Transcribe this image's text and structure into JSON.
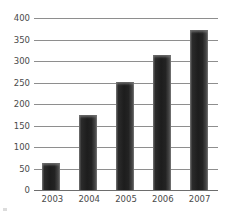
{
  "chart_data": {
    "type": "bar",
    "title": "",
    "subtitle": "",
    "xlabel": "",
    "ylabel": "",
    "categories": [
      "2003",
      "2004",
      "2005",
      "2006",
      "2007"
    ],
    "values": [
      62,
      175,
      252,
      313,
      372
    ],
    "series": [
      {
        "name": "Value",
        "values": [
          62,
          175,
          252,
          313,
          372
        ]
      }
    ],
    "ylim": [
      0,
      400
    ],
    "yticks": [
      0,
      50,
      100,
      150,
      200,
      250,
      300,
      350,
      400
    ],
    "ytick_labels": [
      "0",
      "50",
      "100",
      "150",
      "200",
      "250",
      "300",
      "350",
      "400"
    ],
    "xtick_labels": [
      "2003",
      "2004",
      "2005",
      "2006",
      "2007"
    ],
    "grid": "horizontal",
    "legend": "none",
    "bar_color": "#232323",
    "gridline_color": "#8e8e8e",
    "axis_text_color": "#4a4a4a",
    "background_color": "#ffffff",
    "annotations": []
  },
  "axis": {
    "y": {
      "labels": [
        "400",
        "350",
        "300",
        "250",
        "200",
        "150",
        "100",
        "50",
        "0"
      ]
    },
    "x": {
      "labels": [
        "2003",
        "2004",
        "2005",
        "2006",
        "2007"
      ]
    }
  }
}
